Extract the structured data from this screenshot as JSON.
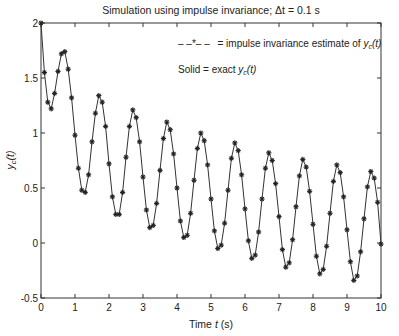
{
  "chart_data": {
    "type": "line",
    "title": "Simulation using impulse invariance; Δt = 0.1 s",
    "xlabel": "Time t (s)",
    "ylabel": "y_c(t)",
    "xlim": [
      0,
      10
    ],
    "ylim": [
      -0.5,
      2
    ],
    "xticks": [
      "0",
      "1",
      "2",
      "3",
      "4",
      "5",
      "6",
      "7",
      "8",
      "9",
      "10"
    ],
    "yticks": [
      "-0.5",
      "0",
      "0.5",
      "1",
      "1.5",
      "2"
    ],
    "grid": false,
    "annotations": [
      {
        "text": "-- * -- = impulse invariance estimate of y_c(t)"
      },
      {
        "text": "Solid = exact y_c(t)"
      }
    ],
    "series": [
      {
        "name": "impulse invariance estimate / exact y_c(t)",
        "marker": "*",
        "dt": 0.1,
        "x_start": 0,
        "values": [
          2.0,
          1.55,
          1.28,
          1.22,
          1.36,
          1.56,
          1.72,
          1.74,
          1.58,
          1.32,
          0.98,
          0.68,
          0.48,
          0.46,
          0.62,
          0.92,
          1.18,
          1.34,
          1.28,
          1.06,
          0.72,
          0.42,
          0.26,
          0.26,
          0.46,
          0.78,
          1.06,
          1.21,
          1.14,
          0.92,
          0.6,
          0.3,
          0.14,
          0.16,
          0.36,
          0.66,
          0.95,
          1.1,
          1.03,
          0.81,
          0.5,
          0.2,
          0.05,
          0.07,
          0.27,
          0.57,
          0.86,
          1.0,
          0.93,
          0.71,
          0.4,
          0.11,
          -0.05,
          -0.02,
          0.18,
          0.48,
          0.77,
          0.91,
          0.84,
          0.62,
          0.31,
          0.02,
          -0.14,
          -0.11,
          0.1,
          0.4,
          0.68,
          0.82,
          0.75,
          0.54,
          0.24,
          -0.06,
          -0.22,
          -0.18,
          0.03,
          0.33,
          0.61,
          0.76,
          0.69,
          0.47,
          0.17,
          -0.12,
          -0.28,
          -0.24,
          -0.03,
          0.27,
          0.56,
          0.71,
          0.64,
          0.42,
          0.12,
          -0.17,
          -0.34,
          -0.3,
          -0.08,
          0.22,
          0.51,
          0.65,
          0.59,
          0.37,
          -0.01
        ]
      }
    ]
  },
  "labels": {
    "title": "Simulation using impulse invariance; Δt = 0.1 s",
    "legend_line1_marker": "– –*– –",
    "legend_line1_text": "= impulse invariance estimate of ",
    "legend_line2_text": "Solid = exact ",
    "yc": "y",
    "yc_sub": "c",
    "yc_arg": "(t)",
    "xlabel_pre": "Time ",
    "xlabel_var": "t",
    "xlabel_post": " (s)"
  }
}
